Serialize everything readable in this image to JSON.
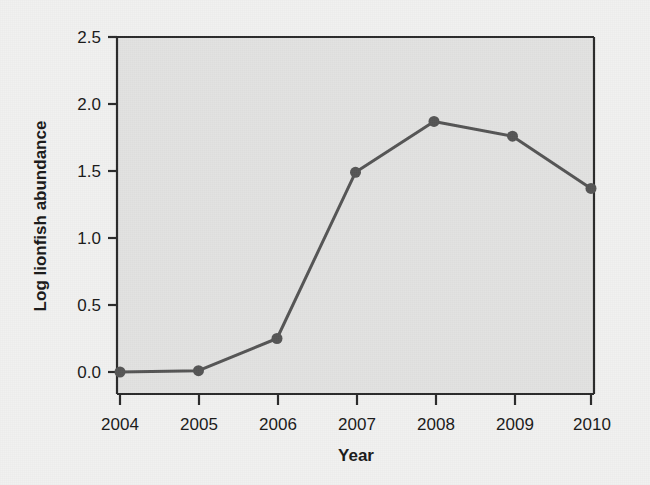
{
  "chart_data": {
    "type": "line",
    "title": "",
    "subtitle": "",
    "xlabel": "Year",
    "ylabel": "Log lionfish abundance",
    "categories": [
      "2004",
      "2005",
      "2006",
      "2007",
      "2008",
      "2009",
      "2010"
    ],
    "x": [
      2004,
      2005,
      2006,
      2007,
      2008,
      2009,
      2010
    ],
    "values": [
      0.0,
      0.01,
      0.25,
      1.49,
      1.87,
      1.76,
      1.37
    ],
    "series": [
      {
        "name": "Log lionfish abundance",
        "values": [
          0.0,
          0.01,
          0.25,
          1.49,
          1.87,
          1.76,
          1.37
        ]
      }
    ],
    "xlim": [
      2004,
      2010
    ],
    "ylim": [
      0.0,
      2.5
    ],
    "xticks": [
      "2004",
      "2005",
      "2006",
      "2007",
      "2008",
      "2009",
      "2010"
    ],
    "yticks": [
      "0.0",
      "0.5",
      "1.0",
      "1.5",
      "2.0",
      "2.5"
    ],
    "ytick_values": [
      0.0,
      0.5,
      1.0,
      1.5,
      2.0,
      2.5
    ],
    "grid": false,
    "legend": null,
    "legend_position": "none",
    "marker": "circle",
    "annotations": []
  },
  "style": {
    "page_background": "#f1f1f0",
    "plot_background": "#e2e2e1",
    "line_color": "#555555",
    "marker_color": "#555555",
    "axis_color": "#2b2b2b",
    "text_color": "#1a1a1a",
    "line_width": 3,
    "marker_radius": 5.5
  }
}
